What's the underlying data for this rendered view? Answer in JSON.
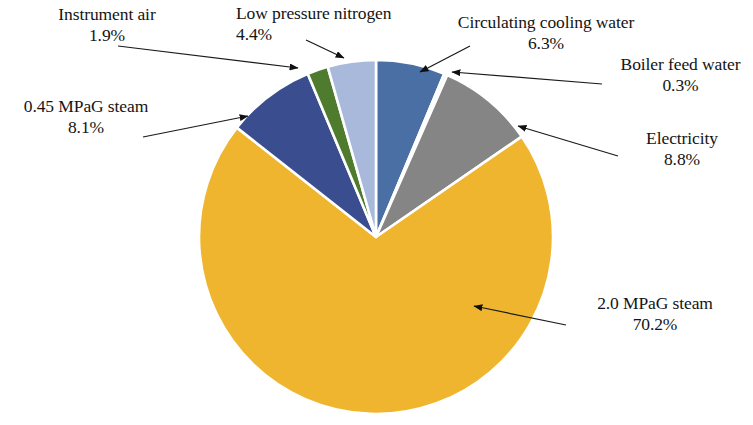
{
  "chart_data": {
    "type": "pie",
    "title": "",
    "subtitle": "",
    "xlabel": "",
    "ylabel": "",
    "legend_position": "none",
    "grid": false,
    "units": "%",
    "start_angle_deg": 0,
    "direction": "clockwise",
    "categories": [
      "Circulating cooling water",
      "Boiler feed water",
      "Electricity",
      "2.0 MPaG steam",
      "0.45 MPaG steam",
      "Instrument air",
      "Low pressure  nitrogen"
    ],
    "values": [
      6.3,
      0.3,
      8.8,
      70.2,
      8.1,
      1.9,
      4.4
    ],
    "colors": [
      "#4a6fa5",
      "#e9eef5",
      "#858585",
      "#f0b52e",
      "#3a4e8f",
      "#4f7b2e",
      "#a9b9dc"
    ],
    "slices": [
      {
        "label": "Circulating cooling water",
        "value": 6.3,
        "value_text": "6.3%",
        "color": "#4a6fa5"
      },
      {
        "label": "Boiler feed water",
        "value": 0.3,
        "value_text": "0.3%",
        "color": "#e9eef5"
      },
      {
        "label": "Electricity",
        "value": 8.8,
        "value_text": "8.8%",
        "color": "#858585"
      },
      {
        "label": "2.0 MPaG steam",
        "value": 70.2,
        "value_text": "70.2%",
        "color": "#f0b52e"
      },
      {
        "label": "0.45 MPaG steam",
        "value": 8.1,
        "value_text": "8.1%",
        "color": "#3a4e8f"
      },
      {
        "label": "Instrument air",
        "value": 1.9,
        "value_text": "1.9%",
        "color": "#4f7b2e"
      },
      {
        "label": "Low pressure  nitrogen",
        "value": 4.4,
        "value_text": "4.4%",
        "color": "#a9b9dc"
      }
    ]
  },
  "callouts": {
    "instrument_air": {
      "name": "Instrument air",
      "pct": "1.9%"
    },
    "low_pressure_nitrogen": {
      "name": "Low pressure  nitrogen",
      "pct": "4.4%"
    },
    "circulating_cooling_water": {
      "name": "Circulating cooling water",
      "pct": "6.3%"
    },
    "boiler_feed_water": {
      "name": "Boiler feed water",
      "pct": "0.3%"
    },
    "steam_045": {
      "name": "0.45 MPaG steam",
      "pct": "8.1%"
    },
    "electricity": {
      "name": "Electricity",
      "pct": "8.8%"
    },
    "steam_20": {
      "name": "2.0 MPaG steam",
      "pct": "70.2%"
    }
  },
  "style": {
    "background": "#ffffff",
    "slice_border": "#ffffff",
    "leader_line": "#1a1a1a",
    "text": "#141414"
  }
}
